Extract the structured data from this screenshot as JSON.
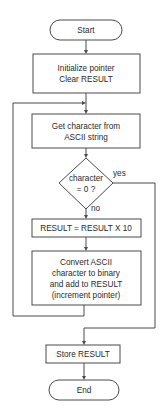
{
  "flowchart": {
    "start": "Start",
    "init": [
      "Initialize pointer",
      "Clear RESULT"
    ],
    "get_char": [
      "Get character from",
      "ASCII string"
    ],
    "decision": [
      "character",
      "= 0 ?"
    ],
    "yes_label": "yes",
    "no_label": "no",
    "multiply": "RESULT = RESULT X 10",
    "convert": [
      "Convert ASCII",
      "character to binary",
      "and add to RESULT",
      "(increment pointer)"
    ],
    "store": "Store RESULT",
    "end": "End"
  }
}
